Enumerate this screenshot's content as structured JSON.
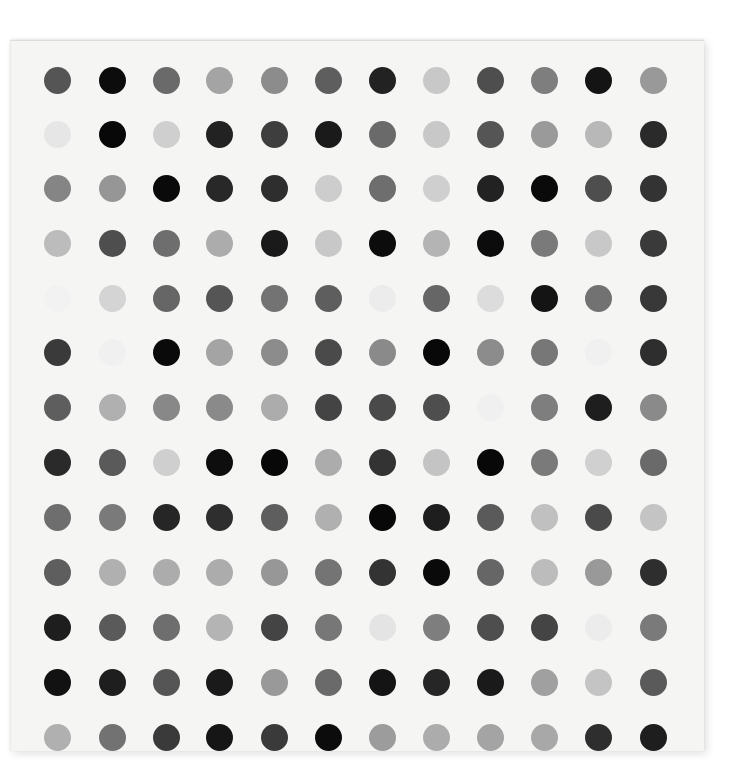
{
  "artwork": {
    "background": "#ffffff",
    "canvas_color": "#f5f5f4",
    "rows": 13,
    "cols": 12,
    "dot_diameter": 27,
    "col_centers": [
      57,
      112,
      166,
      219,
      274,
      328,
      382,
      436,
      490,
      544,
      598,
      653
    ],
    "row_centers": [
      80,
      134,
      188,
      243,
      298,
      352,
      407,
      462,
      517,
      572,
      627,
      682,
      737
    ],
    "grid": [
      [
        "#555555",
        "#0c0c0c",
        "#6a6a6a",
        "#a4a4a4",
        "#8c8c8c",
        "#5e5e5e",
        "#222222",
        "#c8c8c8",
        "#4e4e4e",
        "#7e7e7e",
        "#141414",
        "#999999"
      ],
      [
        "#e6e6e6",
        "#080808",
        "#cfcfcf",
        "#222222",
        "#3e3e3e",
        "#1a1a1a",
        "#6a6a6a",
        "#c8c8c8",
        "#555555",
        "#9a9a9a",
        "#b8b8b8",
        "#2a2a2a"
      ],
      [
        "#858585",
        "#969696",
        "#0a0a0a",
        "#282828",
        "#2e2e2e",
        "#cdcdcd",
        "#6e6e6e",
        "#cfcfcf",
        "#222222",
        "#0a0a0a",
        "#4e4e4e",
        "#333333"
      ],
      [
        "#bcbcbc",
        "#4e4e4e",
        "#6e6e6e",
        "#acacac",
        "#1a1a1a",
        "#c8c8c8",
        "#0c0c0c",
        "#b4b4b4",
        "#0c0c0c",
        "#7a7a7a",
        "#c8c8c8",
        "#3a3a3a"
      ],
      [
        "#f2f2f2",
        "#d4d4d4",
        "#666666",
        "#555555",
        "#737373",
        "#5e5e5e",
        "#ececec",
        "#666666",
        "#dcdcdc",
        "#141414",
        "#727272",
        "#383838"
      ],
      [
        "#3a3a3a",
        "#f0f0f0",
        "#0a0a0a",
        "#a4a4a4",
        "#8c8c8c",
        "#4a4a4a",
        "#8a8a8a",
        "#080808",
        "#8c8c8c",
        "#777777",
        "#f0f0f0",
        "#2e2e2e"
      ],
      [
        "#5e5e5e",
        "#b0b0b0",
        "#888888",
        "#8a8a8a",
        "#acacac",
        "#444444",
        "#4a4a4a",
        "#4e4e4e",
        "#f0f0f0",
        "#7e7e7e",
        "#1e1e1e",
        "#8a8a8a"
      ],
      [
        "#2a2a2a",
        "#5a5a5a",
        "#cfcfcf",
        "#0e0e0e",
        "#080808",
        "#acacac",
        "#333333",
        "#c4c4c4",
        "#080808",
        "#7a7a7a",
        "#d0d0d0",
        "#6a6a6a"
      ],
      [
        "#6e6e6e",
        "#7a7a7a",
        "#262626",
        "#2e2e2e",
        "#5e5e5e",
        "#b0b0b0",
        "#080808",
        "#1e1e1e",
        "#5a5a5a",
        "#c0c0c0",
        "#4a4a4a",
        "#c4c4c4"
      ],
      [
        "#5e5e5e",
        "#b0b0b0",
        "#acacac",
        "#acacac",
        "#979797",
        "#747474",
        "#333333",
        "#0a0a0a",
        "#666666",
        "#bcbcbc",
        "#999999",
        "#2e2e2e"
      ],
      [
        "#1e1e1e",
        "#5a5a5a",
        "#6e6e6e",
        "#b4b4b4",
        "#444444",
        "#777777",
        "#e4e4e4",
        "#7e7e7e",
        "#4e4e4e",
        "#444444",
        "#ececec",
        "#7a7a7a"
      ],
      [
        "#121212",
        "#1e1e1e",
        "#555555",
        "#1a1a1a",
        "#999999",
        "#6a6a6a",
        "#141414",
        "#262626",
        "#1a1a1a",
        "#a0a0a0",
        "#c4c4c4",
        "#5a5a5a"
      ],
      [
        "#b0b0b0",
        "#727272",
        "#3a3a3a",
        "#161616",
        "#3a3a3a",
        "#0c0c0c",
        "#9c9c9c",
        "#acacac",
        "#a4a4a4",
        "#a8a8a8",
        "#2e2e2e",
        "#1e1e1e"
      ]
    ]
  }
}
